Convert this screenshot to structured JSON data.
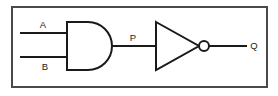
{
  "figure": {
    "name": "logic-circuit-diagram",
    "border_color": "#4a4a4a",
    "line_color": "#1a1a1a",
    "background_color": "#ffffff"
  },
  "signals": {
    "input_a": "A",
    "input_b": "B",
    "intermediate": "P",
    "output": "Q"
  },
  "gates": [
    {
      "id": "and-gate",
      "type": "AND",
      "inputs": [
        "A",
        "B"
      ],
      "output": "P"
    },
    {
      "id": "not-gate",
      "type": "NOT",
      "inputs": [
        "P"
      ],
      "output": "Q"
    }
  ],
  "geometry": {
    "frame": {
      "x": 12,
      "y": 7,
      "width": 255,
      "height": 80
    },
    "and_gate": {
      "x": 66,
      "y": 22,
      "width": 45,
      "height": 48
    },
    "not_gate": {
      "x": 155,
      "y": 22,
      "width": 45,
      "height": 48
    },
    "bubble": {
      "cx": 204,
      "cy": 46,
      "r": 5
    },
    "wire_a_y": 33,
    "wire_b_y": 57,
    "wire_main_y": 46
  },
  "labels": {
    "a": {
      "text": "A",
      "x": 43,
      "y": 28
    },
    "b": {
      "text": "B",
      "x": 45,
      "y": 70
    },
    "p": {
      "text": "P",
      "x": 133,
      "y": 41
    },
    "q": {
      "text": "Q",
      "x": 254,
      "y": 49
    }
  }
}
